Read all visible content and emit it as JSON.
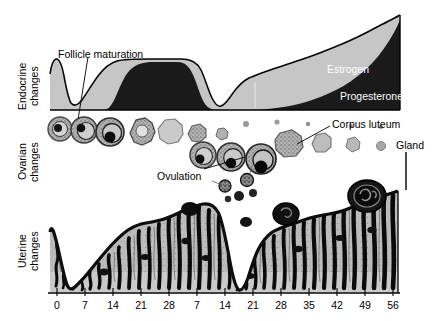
{
  "figure": {
    "width": 435,
    "height": 321
  },
  "row_labels": [
    {
      "id": "endocrine",
      "text": "Endocrine\nchanges"
    },
    {
      "id": "ovarian",
      "text": "Ovarian\nchanges"
    },
    {
      "id": "uterine",
      "text": "Uterine\nchanges"
    }
  ],
  "annotations": [
    {
      "id": "follicle-maturation",
      "text": "Follicle maturation",
      "x": 58,
      "y": 48,
      "on_chart": false
    },
    {
      "id": "estrogen",
      "text": "Estrogen",
      "x": 327,
      "y": 63,
      "on_chart": true
    },
    {
      "id": "progesterone",
      "text": "Progesterone",
      "x": 340,
      "y": 90,
      "on_chart": true
    },
    {
      "id": "corpus-luteum",
      "text": "Corpus luteum",
      "x": 332,
      "y": 118,
      "on_chart": false
    },
    {
      "id": "gland",
      "text": "Gland",
      "x": 396,
      "y": 143,
      "on_chart": false
    },
    {
      "id": "ovulation",
      "text": "Ovulation",
      "x": 157,
      "y": 171,
      "on_chart": false
    }
  ],
  "colors": {
    "estrogen_fill": "#c6c6c6",
    "progesterone_fill": "#1a1a1a",
    "outline": "#000000",
    "endometrium_fill": "#bdbdbd",
    "background": "#ffffff",
    "follicle_fill": "#a8a8a8",
    "text": "#000000",
    "text_on_chart": "#ffffff"
  },
  "chart_data": {
    "type": "area",
    "xlabel": "",
    "ylabel": "",
    "grid": false,
    "legend_position": "inline-on-chart",
    "xlim": [
      0,
      56
    ],
    "axis": {
      "tick_values": [
        0,
        7,
        14,
        21,
        28,
        35,
        42,
        49,
        56,
        63,
        70,
        77,
        84
      ],
      "tick_labels": [
        "0",
        "7",
        "14",
        "21",
        "28",
        "7",
        "14",
        "21",
        "28",
        "35",
        "42",
        "49",
        "56"
      ],
      "tick_pixel_x": [
        57,
        85,
        113,
        141,
        169,
        197,
        225,
        253,
        281,
        309,
        337,
        365,
        393
      ],
      "note": "Two consecutive cycles; day counter restarts at 28 then continues to 56"
    },
    "series": [
      {
        "name": "Estrogen",
        "fill": "#c6c6c6",
        "x": [
          0,
          2,
          4,
          7,
          10,
          13,
          16,
          20,
          24,
          28,
          31,
          34,
          37,
          40,
          45,
          50,
          56,
          63,
          70,
          77,
          84
        ],
        "values": [
          45,
          62,
          40,
          10,
          8,
          22,
          48,
          62,
          63,
          63,
          62,
          40,
          22,
          18,
          24,
          34,
          44,
          56,
          68,
          82,
          100
        ]
      },
      {
        "name": "Progesterone",
        "fill": "#1a1a1a",
        "x": [
          0,
          4,
          7,
          10,
          14,
          17,
          20,
          24,
          28,
          31,
          34,
          37,
          42,
          48,
          56,
          63,
          70,
          77,
          84
        ],
        "values": [
          0,
          0,
          0,
          0,
          2,
          18,
          38,
          48,
          48,
          40,
          18,
          4,
          2,
          3,
          5,
          8,
          14,
          34,
          72
        ]
      }
    ],
    "ovarian_sequence": [
      {
        "stage": "primordial-follicle",
        "x": 57,
        "size": 13
      },
      {
        "stage": "primary-follicle",
        "x": 77,
        "size": 15
      },
      {
        "stage": "secondary-follicle",
        "x": 98,
        "size": 17
      },
      {
        "stage": "graafian-follicle",
        "x": 120,
        "size": 16
      },
      {
        "stage": "ruptured-follicle",
        "x": 142,
        "size": 15
      },
      {
        "stage": "corpus-luteum-early",
        "x": 163,
        "size": 12
      },
      {
        "stage": "corpus-albicans",
        "x": 182,
        "size": 9
      },
      {
        "stage": "primordial-follicle",
        "x": 198,
        "size": 13
      },
      {
        "stage": "primary-follicle",
        "x": 220,
        "size": 15
      },
      {
        "stage": "graafian-follicle",
        "x": 243,
        "size": 17
      },
      {
        "stage": "ruptured-follicle",
        "x": 266,
        "size": 15
      },
      {
        "stage": "corpus-luteum",
        "x": 290,
        "size": 16
      },
      {
        "stage": "corpus-luteum-regressing",
        "x": 314,
        "size": 13
      },
      {
        "stage": "corpus-albicans",
        "x": 340,
        "size": 10
      },
      {
        "stage": "corpus-albicans-small",
        "x": 364,
        "size": 8
      }
    ],
    "uterine_thickness": {
      "description": "Endometrial thickness across two cycles (relative units, 0-100)",
      "x": [
        0,
        3,
        5,
        7,
        9,
        12,
        16,
        20,
        24,
        28,
        30,
        32,
        34,
        36,
        40,
        46,
        52,
        58,
        64,
        70,
        76,
        82,
        84
      ],
      "values": [
        72,
        30,
        10,
        8,
        14,
        30,
        48,
        62,
        78,
        86,
        80,
        40,
        12,
        10,
        20,
        38,
        56,
        70,
        80,
        88,
        94,
        98,
        98
      ]
    }
  }
}
